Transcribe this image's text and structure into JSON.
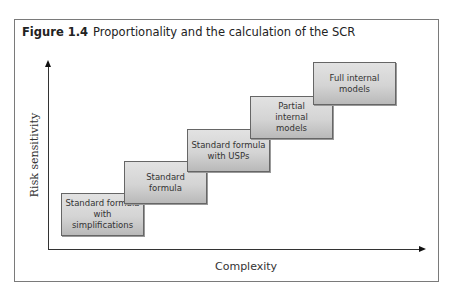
{
  "figure": {
    "label": "Figure 1.4",
    "title": "Proportionality and the calculation of the SCR"
  },
  "axes": {
    "y_label": "Risk sensitivity",
    "x_label": "Complexity"
  },
  "steps": [
    {
      "label": "Standard formula with simplifications"
    },
    {
      "label": "Standard formula"
    },
    {
      "label": "Standard formula with USPs"
    },
    {
      "label": "Partial internal models"
    },
    {
      "label": "Full internal models"
    }
  ],
  "colors": {
    "box_fill": "#d4d4d4",
    "box_border": "#666666",
    "axis": "#333333"
  }
}
